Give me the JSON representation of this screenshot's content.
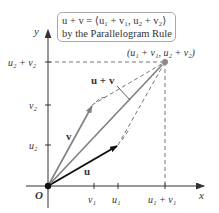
{
  "diagram": {
    "callout": {
      "line1": "u + v = ⟨u₁ + v₁, u₂ + v₂⟩",
      "line2": "by the Parallelogram Rule"
    },
    "axes": {
      "x_label": "x",
      "y_label": "y",
      "origin_label": "O"
    },
    "x_ticks": [
      "v₁",
      "u₁",
      "u₁ + v₁"
    ],
    "y_ticks": [
      "u₂",
      "v₂",
      "u₂ + v₂"
    ],
    "vectors": [
      {
        "name": "u",
        "label": "u",
        "color": "#111111"
      },
      {
        "name": "v",
        "label": "v",
        "color": "#777777"
      },
      {
        "name": "u+v",
        "label": "u + v",
        "color": "#777777"
      }
    ],
    "sum_point_label": "(u₁ + v₁, u₂ + v₂)",
    "colors": {
      "axis": "#333333",
      "u_vector": "#111111",
      "v_vector": "#808080",
      "sum_vector": "#808080",
      "dashed": "#555555",
      "sum_point": "#888888"
    }
  }
}
